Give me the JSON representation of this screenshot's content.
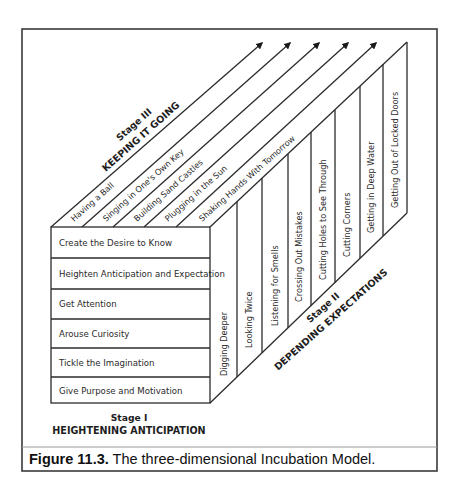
{
  "diagram": {
    "title": "Three-dimensional Incubation Model",
    "stage1": {
      "title": "Stage I",
      "subtitle": "HEIGHTENING ANTICIPATION",
      "rows": [
        "Create the Desire to Know",
        "Heighten Anticipation and Expectation",
        "Get Attention",
        "Arouse Curiosity",
        "Tickle the Imagination",
        "Give Purpose and Motivation"
      ]
    },
    "stage2": {
      "title": "Stage II",
      "subtitle": "DEPENDING EXPECTATIONS",
      "columns": [
        "Digging Deeper",
        "Looking Twice",
        "Listening for Smells",
        "Crossing Out Mistakes",
        "Cutting Holes to See Through",
        "Cutting Corners",
        "Getting in Deep Water",
        "Getting Out of Locked Doors"
      ]
    },
    "stage3": {
      "title": "Stage III",
      "subtitle": "KEEPING IT GOING",
      "strips": [
        "Having a Ball",
        "Singing in One's Own Key",
        "Building Sand Castles",
        "Plugging in the Sun",
        "Shaking Hands With Tomorrow"
      ]
    }
  },
  "caption": {
    "label": "Figure 11.3.",
    "text": " The three-dimensional Incubation Model."
  },
  "colors": {
    "line": "#2b2b2b",
    "frame": "#3a3a3a",
    "separator": "#9a9a9a",
    "background": "#ffffff"
  }
}
